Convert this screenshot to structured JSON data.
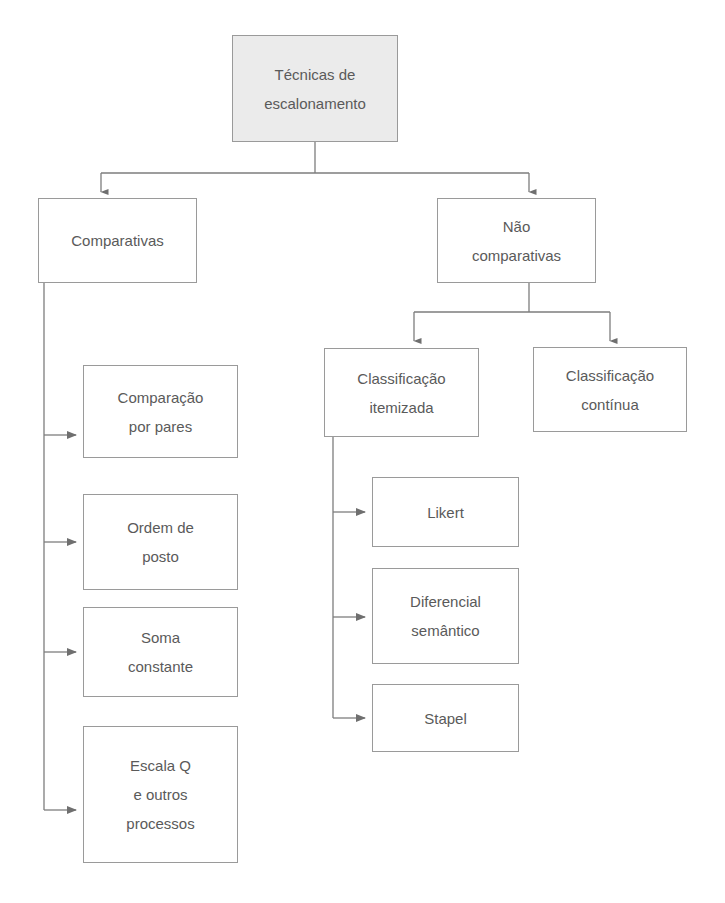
{
  "diagram": {
    "title_text": "Técnicas de escalonamento",
    "language": "pt-BR",
    "colors": {
      "box_border": "#9a9a9a",
      "root_fill": "#ebebeb",
      "box_fill": "#ffffff",
      "text": "#5a5a5a",
      "connector": "#7d7d7d",
      "page_background": "#ffffff"
    },
    "nodes": {
      "root": {
        "id": "tecnicas-de-escalonamento",
        "lines": [
          "Técnicas de",
          "escalonamento"
        ]
      },
      "comparativas": {
        "id": "comparativas",
        "lines": [
          "Comparativas"
        ]
      },
      "nao_comparativas": {
        "id": "nao-comparativas",
        "lines": [
          "Não",
          "comparativas"
        ]
      },
      "classificacao_itemizada": {
        "id": "classificacao-itemizada",
        "lines": [
          "Classificação",
          "itemizada"
        ]
      },
      "classificacao_continua": {
        "id": "classificacao-continua",
        "lines": [
          "Classificação",
          "contínua"
        ]
      },
      "comparacao_por_pares": {
        "id": "comparacao-por-pares",
        "lines": [
          "Comparação",
          "por pares"
        ]
      },
      "ordem_de_posto": {
        "id": "ordem-de-posto",
        "lines": [
          "Ordem de",
          "posto"
        ]
      },
      "soma_constante": {
        "id": "soma-constante",
        "lines": [
          "Soma",
          "constante"
        ]
      },
      "escala_q": {
        "id": "escala-q-e-outros-processos",
        "lines": [
          "Escala Q",
          "e outros",
          "processos"
        ]
      },
      "likert": {
        "id": "likert",
        "lines": [
          "Likert"
        ]
      },
      "diferencial_semantico": {
        "id": "diferencial-semantico",
        "lines": [
          "Diferencial",
          "semântico"
        ]
      },
      "stapel": {
        "id": "stapel",
        "lines": [
          "Stapel"
        ]
      }
    },
    "edges": [
      {
        "from": "root",
        "to": "comparativas",
        "arrow": true
      },
      {
        "from": "root",
        "to": "nao_comparativas",
        "arrow": true
      },
      {
        "from": "nao_comparativas",
        "to": "classificacao_itemizada",
        "arrow": true
      },
      {
        "from": "nao_comparativas",
        "to": "classificacao_continua",
        "arrow": true
      },
      {
        "from": "comparativas",
        "to": "comparacao_por_pares",
        "arrow": true
      },
      {
        "from": "comparativas",
        "to": "ordem_de_posto",
        "arrow": true
      },
      {
        "from": "comparativas",
        "to": "soma_constante",
        "arrow": true
      },
      {
        "from": "comparativas",
        "to": "escala_q",
        "arrow": true
      },
      {
        "from": "classificacao_itemizada",
        "to": "likert",
        "arrow": true
      },
      {
        "from": "classificacao_itemizada",
        "to": "diferencial_semantico",
        "arrow": true
      },
      {
        "from": "classificacao_itemizada",
        "to": "stapel",
        "arrow": true
      }
    ]
  }
}
